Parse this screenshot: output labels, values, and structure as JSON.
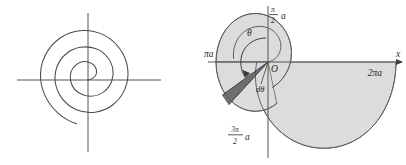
{
  "figure": {
    "panels": [
      {
        "id": "left",
        "name": "plain-spiral",
        "description": "Archimedean spiral plotted on bare x-y axes",
        "has_shading": false,
        "labels": []
      },
      {
        "id": "right",
        "name": "annotated-spiral",
        "description": "Archimedean spiral with shaded swept area and d-theta wedge",
        "has_shading": true,
        "labels": [
          {
            "key": "y_axis_value",
            "text": "a",
            "prefix_num": "π",
            "prefix_den": "2",
            "kind": "fraction",
            "x": 72,
            "y": 14
          },
          {
            "key": "x_axis_negative",
            "text": "πa",
            "kind": "plain",
            "x": 3,
            "y": 45
          },
          {
            "key": "x_axis_positive",
            "text": "2πa",
            "kind": "plain",
            "x": 152,
            "y": 68
          },
          {
            "key": "x_axis_name",
            "text": "x",
            "kind": "plain",
            "x": 182,
            "y": 62
          },
          {
            "key": "origin",
            "text": "O",
            "kind": "plain",
            "x": 69,
            "y": 68
          },
          {
            "key": "angle",
            "text": "θ",
            "kind": "plain",
            "x": 42,
            "y": 36
          },
          {
            "key": "angle_increment",
            "text": "dθ",
            "kind": "plain",
            "x": 54,
            "y": 92
          },
          {
            "key": "y_axis_negative",
            "text": "a",
            "prefix_num": "3π",
            "prefix_den": "2",
            "kind": "fraction",
            "x": 26,
            "y": 139
          }
        ]
      }
    ],
    "colors": {
      "axis": "#545454",
      "curve": "#4a4a4a",
      "region_light": "#dcdcdc",
      "region_dark": "#6f6f6f",
      "label_text": "#2b2b2b",
      "background": "#ffffff"
    }
  }
}
